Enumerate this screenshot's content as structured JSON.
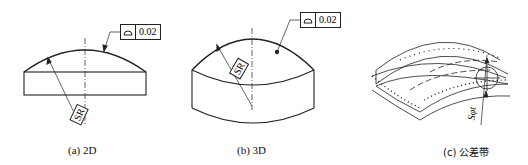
{
  "figure": {
    "panels": [
      {
        "id": "a",
        "caption": "(a) 2D",
        "frame": {
          "symbol": "surface-profile",
          "tolerance": "0.02"
        },
        "dimension_label": "SR"
      },
      {
        "id": "b",
        "caption": "(b) 3D",
        "frame": {
          "symbol": "surface-profile",
          "tolerance": "0.02"
        },
        "dimension_label": "SR"
      },
      {
        "id": "c",
        "caption": "(c) 公差带",
        "dimension_label": "Sφt"
      }
    ]
  },
  "colors": {
    "line": "#222222",
    "background": "#ffffff"
  }
}
